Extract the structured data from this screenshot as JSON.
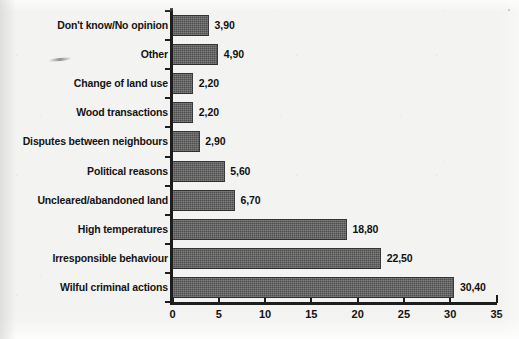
{
  "chart_data": {
    "type": "bar",
    "orientation": "horizontal",
    "title": "",
    "subtitle": "",
    "xlabel": "",
    "ylabel": "",
    "xlim": [
      0,
      35
    ],
    "xticks": [
      0,
      5,
      10,
      15,
      20,
      25,
      30,
      35
    ],
    "xtick_labels": [
      "0",
      "5",
      "10",
      "15",
      "20",
      "25",
      "30",
      "35"
    ],
    "grid": false,
    "legend": false,
    "decimal_separator": ",",
    "bar_color": "#4e4e4e",
    "axis_color": "#1d1d1d",
    "background_color": "#f3f3f1",
    "text_color": "#141414",
    "categories": [
      "Don't know/No opinion",
      "Other",
      "Change of land use",
      "Wood transactions",
      "Disputes between neighbours",
      "Political reasons",
      "Uncleared/abandoned land",
      "High temperatures",
      "Irresponsible behaviour",
      "Wilful criminal actions"
    ],
    "values": [
      3.9,
      4.9,
      2.2,
      2.2,
      2.9,
      5.6,
      6.7,
      18.8,
      22.5,
      30.4
    ],
    "value_labels": [
      "3,90",
      "4,90",
      "2,20",
      "2,20",
      "2,90",
      "5,60",
      "6,70",
      "18,80",
      "22,50",
      "30,40"
    ]
  }
}
